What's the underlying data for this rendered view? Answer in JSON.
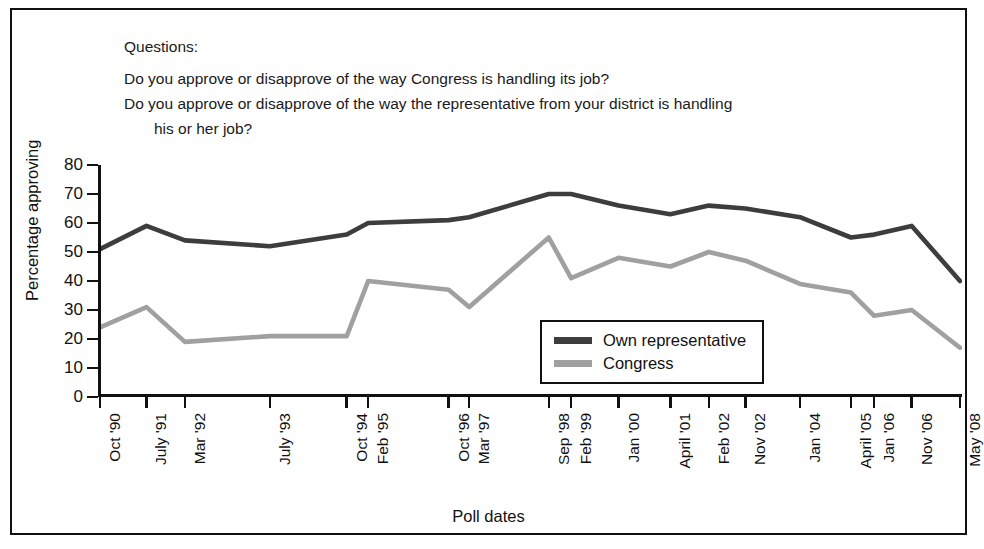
{
  "questions": {
    "heading": "Questions:",
    "lines": [
      "Do you approve or disapprove of the way Congress is handling its job?",
      "Do you approve or disapprove of the way the representative from your district is handling",
      "his or her job?"
    ]
  },
  "colors": {
    "own_representative": "#3d3d3d",
    "congress": "#a0a0a0",
    "axis": "#111111",
    "background": "#ffffff"
  },
  "legend": {
    "position": "inside-lower-right",
    "items": [
      {
        "label": "Own representative",
        "color": "#3d3d3d"
      },
      {
        "label": "Congress",
        "color": "#a0a0a0"
      }
    ]
  },
  "chart_data": {
    "type": "line",
    "title": "",
    "xlabel": "Poll dates",
    "ylabel": "Percentage approving",
    "ylim": [
      0,
      80
    ],
    "yticks": [
      0,
      10,
      20,
      30,
      40,
      50,
      60,
      70,
      80
    ],
    "grid": false,
    "legend_position": "inside-lower-right",
    "categories": [
      "Oct '90",
      "July '91",
      "Mar '92",
      "July '93",
      "Oct '94",
      "Feb '95",
      "Oct '96",
      "Mar '97",
      "Sep '98",
      "Feb '99",
      "Jan '00",
      "April '01",
      "Feb '02",
      "Nov '02",
      "Jan '04",
      "April '05",
      "Jan '06",
      "Nov '06",
      "May '08"
    ],
    "x_positions": [
      0,
      52,
      95,
      190,
      276,
      300,
      390,
      413,
      502,
      527,
      580,
      638,
      681,
      722,
      783,
      840,
      866,
      908,
      962
    ],
    "series": [
      {
        "name": "Own representative",
        "color": "#3d3d3d",
        "values": [
          51,
          59,
          54,
          52,
          56,
          60,
          61,
          62,
          70,
          70,
          66,
          63,
          66,
          65,
          62,
          55,
          56,
          59,
          40
        ]
      },
      {
        "name": "Congress",
        "color": "#a0a0a0",
        "values": [
          24,
          31,
          19,
          21,
          21,
          40,
          37,
          31,
          55,
          41,
          48,
          45,
          50,
          47,
          39,
          36,
          28,
          30,
          17
        ]
      }
    ]
  }
}
